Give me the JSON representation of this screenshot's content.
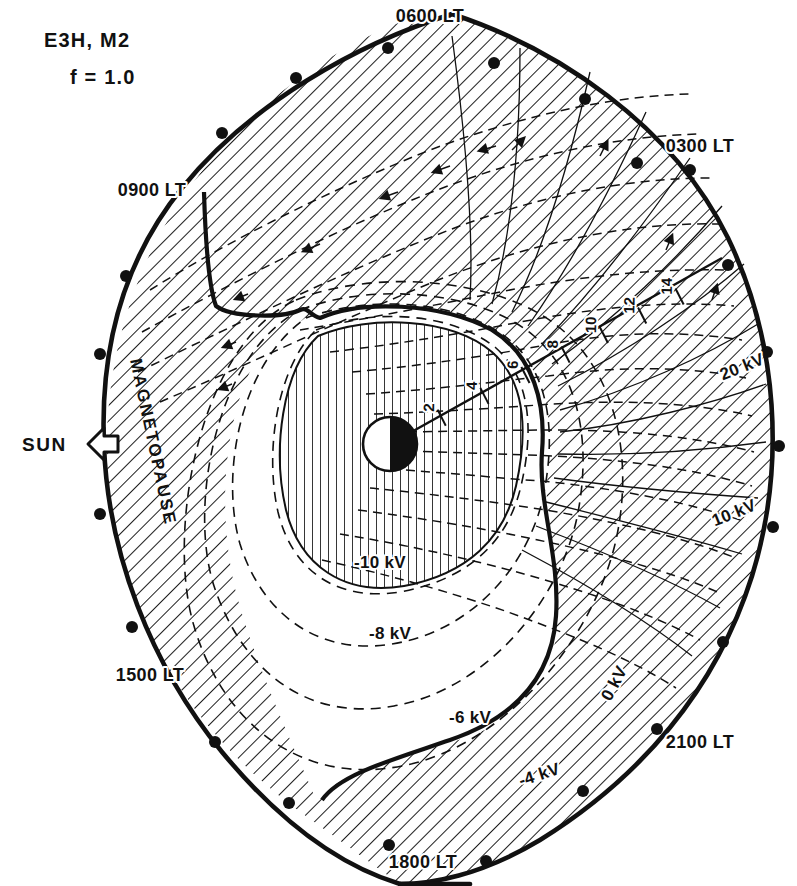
{
  "figure": {
    "title_line1": "E3H, M2",
    "title_line2": "f = 1.0",
    "sun_label": "SUN",
    "magnetopause_label": "MAGNETOPAUSE",
    "type": "polar-contour-map"
  },
  "local_time_labels": [
    {
      "text": "0600 LT",
      "x": 430,
      "y": 22
    },
    {
      "text": "0300 LT",
      "x": 700,
      "y": 152
    },
    {
      "text": "0900 LT",
      "x": 152,
      "y": 196
    },
    {
      "text": "1500 LT",
      "x": 150,
      "y": 681
    },
    {
      "text": "2100 LT",
      "x": 700,
      "y": 748
    },
    {
      "text": "1800 LT",
      "x": 423,
      "y": 868
    }
  ],
  "contour_labels": [
    {
      "text": "20 kV",
      "x": 744,
      "y": 372,
      "rot": -22
    },
    {
      "text": "10 kV",
      "x": 736,
      "y": 518,
      "rot": -22
    },
    {
      "text": "0 kV",
      "x": 619,
      "y": 686,
      "rot": -62
    },
    {
      "text": "-4 kV",
      "x": 541,
      "y": 780,
      "rot": -18
    },
    {
      "text": "-6 kV",
      "x": 470,
      "y": 723,
      "rot": 0
    },
    {
      "text": "-8 kV",
      "x": 390,
      "y": 639,
      "rot": 0
    },
    {
      "text": "-10 kV",
      "x": 380,
      "y": 568,
      "rot": 0
    }
  ],
  "radial_axis": {
    "label_unit": "Re",
    "ticks": [
      {
        "value": "2",
        "r": 58
      },
      {
        "value": "4",
        "r": 106
      },
      {
        "value": "6",
        "r": 152
      },
      {
        "value": "8",
        "r": 197
      },
      {
        "value": "10",
        "r": 240
      },
      {
        "value": "12",
        "r": 283
      },
      {
        "value": "14",
        "r": 325
      }
    ],
    "origin": {
      "x": 390,
      "y": 444
    },
    "direction_deg": -27
  },
  "chart_data": {
    "type": "contour",
    "title": "E3H, M2  f = 1.0",
    "quantity": "Electric potential",
    "unit": "kV",
    "contour_levels": [
      -10,
      -8,
      -6,
      -4,
      0,
      10,
      20
    ],
    "radial_ticks": [
      2,
      4,
      6,
      8,
      10,
      12,
      14
    ],
    "radial_unit": "Re",
    "azimuth_labels": [
      "0600 LT",
      "0300 LT",
      "0900 LT",
      "1500 LT",
      "2100 LT",
      "1800 LT"
    ],
    "boundaries": [
      "magnetopause",
      "separatrix"
    ],
    "legend": "none",
    "grid": false
  },
  "colors": {
    "ink": "#111111",
    "background": "#ffffff"
  },
  "perimeter_dots": [
    {
      "x": 296,
      "y": 78
    },
    {
      "x": 222,
      "y": 133
    },
    {
      "x": 126,
      "y": 276
    },
    {
      "x": 100,
      "y": 354
    },
    {
      "x": 100,
      "y": 514
    },
    {
      "x": 132,
      "y": 627
    },
    {
      "x": 215,
      "y": 742
    },
    {
      "x": 289,
      "y": 803
    },
    {
      "x": 389,
      "y": 845
    },
    {
      "x": 486,
      "y": 861
    },
    {
      "x": 583,
      "y": 791
    },
    {
      "x": 657,
      "y": 729
    },
    {
      "x": 723,
      "y": 642
    },
    {
      "x": 773,
      "y": 527
    },
    {
      "x": 779,
      "y": 446
    },
    {
      "x": 767,
      "y": 352
    },
    {
      "x": 728,
      "y": 265
    },
    {
      "x": 690,
      "y": 170
    },
    {
      "x": 637,
      "y": 163
    },
    {
      "x": 585,
      "y": 99
    },
    {
      "x": 494,
      "y": 63
    },
    {
      "x": 388,
      "y": 48
    }
  ]
}
